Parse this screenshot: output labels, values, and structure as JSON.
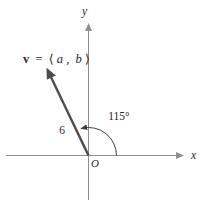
{
  "figure": {
    "background": "#ffffff",
    "axes": {
      "x_label": "x",
      "y_label": "y",
      "origin_label": "O"
    },
    "vector": {
      "label_parts": {
        "v": "v",
        "eq": " = ",
        "open": "⟨",
        "a": "a",
        "sep": ", ",
        "b": "b",
        "close": "⟩"
      },
      "magnitude_label": "6",
      "angle_label": "115°",
      "angle_degrees": 115,
      "magnitude": 6
    },
    "colors": {
      "axis": "#8f8f8f",
      "vector": "#4d4d4d",
      "arc": "#3f3f3f",
      "text": "#262626"
    }
  }
}
